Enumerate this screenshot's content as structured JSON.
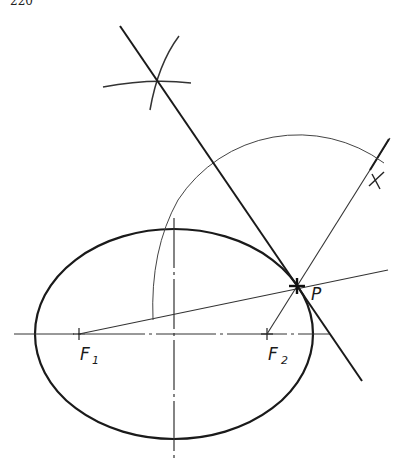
{
  "page": {
    "number": "220"
  },
  "figure": {
    "labels": {
      "p": "P",
      "x": "X",
      "f1": "F",
      "f1_sub": "1",
      "f2": "F",
      "f2_sub": "2"
    },
    "colors": {
      "ink": "#1a1a1a",
      "light_ink": "#444444",
      "background": "#ffffff"
    },
    "elements": [
      "ellipse",
      "major-axis",
      "minor-axis",
      "focus-F1",
      "focus-F2",
      "point-P",
      "line-F1-P",
      "line-F2-P-X",
      "arc-radius-PX",
      "bisector-arcs",
      "tangent-line"
    ]
  }
}
